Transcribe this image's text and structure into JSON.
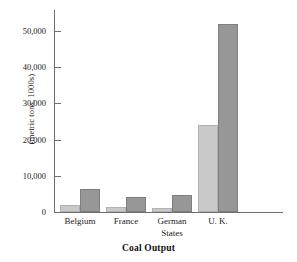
{
  "chart_data": {
    "type": "bar",
    "title": "Coal Output",
    "xlabel": "",
    "ylabel": "(metric tons, 1000s)",
    "categories": [
      "Belgium",
      "France",
      "German\nStates",
      "U. K."
    ],
    "series": [
      {
        "name": "light-series",
        "color": "#c9c9c9",
        "values": [
          2000,
          1400,
          1000,
          24000
        ]
      },
      {
        "name": "dark-series",
        "color": "#979797",
        "values": [
          6300,
          4100,
          4800,
          52000
        ]
      }
    ],
    "ylim": [
      0,
      55000
    ],
    "yticks": [
      0,
      10000,
      20000,
      30000,
      40000,
      50000
    ],
    "ytick_labels": [
      "0",
      "10,000",
      "20,000",
      "30,000",
      "40,000",
      "50,000"
    ],
    "grid": false,
    "legend": "none"
  }
}
